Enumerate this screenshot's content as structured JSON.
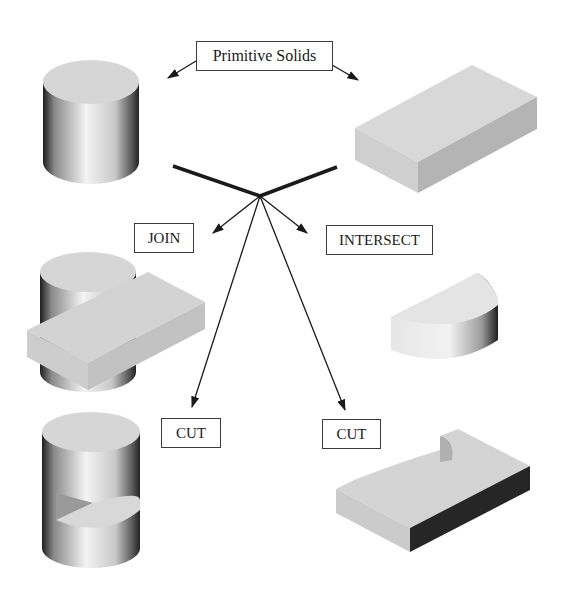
{
  "diagram": {
    "title_label": "Primitive Solids",
    "operations": [
      {
        "id": "join",
        "label": "JOIN"
      },
      {
        "id": "intersect",
        "label": "INTERSECT"
      },
      {
        "id": "cut_left",
        "label": "CUT"
      },
      {
        "id": "cut_right",
        "label": "CUT"
      }
    ],
    "primitives": [
      "cylinder",
      "rectangular block"
    ],
    "results": [
      {
        "operation": "JOIN",
        "shape": "cylinder joined with block"
      },
      {
        "operation": "INTERSECT",
        "shape": "half-cylinder segment"
      },
      {
        "operation": "CUT",
        "shape": "cylinder with block cut out"
      },
      {
        "operation": "CUT",
        "shape": "block with cylindrical notch"
      }
    ],
    "colors": {
      "background": "#ffffff",
      "line": "#1a1a1a",
      "face_light": "#d9d9d9",
      "face_mid": "#c4c4c4",
      "face_dark": "#2a2a2a"
    }
  }
}
